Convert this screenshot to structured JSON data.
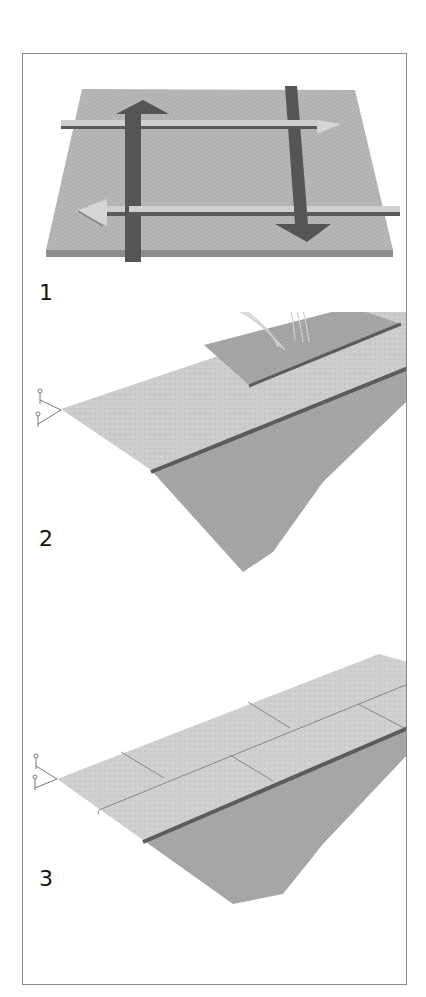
{
  "figure": {
    "type": "instructional-illustration",
    "colors": {
      "surface_light": "#c9c9c9",
      "surface_mid": "#a9a9a9",
      "board_dark": "#5c5c5c",
      "arrow_dark": "#545454",
      "frame_border": "#8a8a8a"
    },
    "steps": [
      {
        "number": "1",
        "description": "Square sheet with two dark arrows (up and down) and two horizontal strips with light arrows indicating direction of laying"
      },
      {
        "number": "2",
        "description": "Hands positioning a board onto a textured sloped sheet with a nailed left corner"
      },
      {
        "number": "3",
        "description": "Textured sloped sheet with shingle-style seams and a nailed left corner"
      }
    ]
  }
}
